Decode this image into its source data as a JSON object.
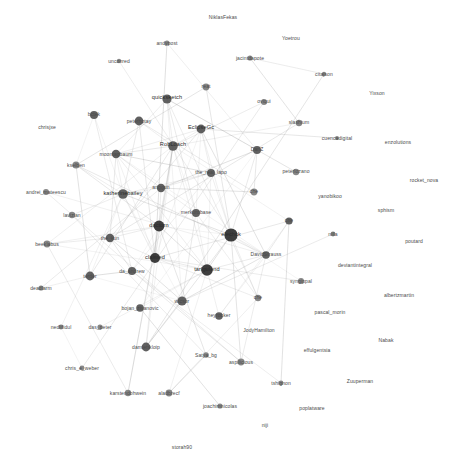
{
  "figure": {
    "type": "network-graph",
    "width": 457,
    "height": 461,
    "background": "#ffffff",
    "edge_color": "#9a9a9a",
    "node_fill_dark": "#2f2f2f",
    "node_fill_mid": "#545454",
    "node_fill_light": "#7d7d7d",
    "label_color": "#3a3a3a"
  },
  "chart_data": {
    "type": "scatter",
    "title": "",
    "xlabel": "",
    "ylabel": "",
    "layout": "force-directed",
    "grid": false,
    "legend": null,
    "node_count": 62,
    "nodes": [
      {
        "id": "NiklasFekas",
        "label": "NiklasFekas",
        "x": 223,
        "y": 17,
        "r": 0,
        "degree": 0,
        "lx": 223,
        "ly": 17,
        "cls": "sm"
      },
      {
        "id": "Yoetrou",
        "label": "Yoetrou",
        "x": 291,
        "y": 38,
        "r": 0,
        "degree": 0,
        "lx": 291,
        "ly": 38,
        "cls": "sm"
      },
      {
        "id": "Yixson",
        "label": "Yixson",
        "x": 377,
        "y": 93,
        "r": 0,
        "degree": 0,
        "lx": 377,
        "ly": 93,
        "cls": "sm"
      },
      {
        "id": "andypost",
        "label": "andypost",
        "x": 167,
        "y": 43,
        "r": 2.6,
        "degree": 9,
        "lx": 167,
        "ly": 43,
        "cls": "sm"
      },
      {
        "id": "unconred",
        "label": "unconred",
        "x": 119,
        "y": 61,
        "r": 2.2,
        "degree": 5,
        "lx": 119,
        "ly": 61,
        "cls": "sm"
      },
      {
        "id": "jacintdapote",
        "label": "jacintdapote",
        "x": 250,
        "y": 58,
        "r": 2.6,
        "degree": 8,
        "lx": 250,
        "ly": 58,
        "cls": "sm"
      },
      {
        "id": "citajson",
        "label": "citajson",
        "x": 324,
        "y": 74,
        "r": 2.2,
        "degree": 4,
        "lx": 324,
        "ly": 74,
        "cls": "sm"
      },
      {
        "id": "reat",
        "label": "reat",
        "x": 206,
        "y": 87,
        "r": 3.4,
        "degree": 14,
        "lx": 206,
        "ly": 86,
        "cls": "sm"
      },
      {
        "id": "quicksketch",
        "label": "quicksketch",
        "x": 167,
        "y": 99,
        "r": 4.6,
        "degree": 26,
        "lx": 167,
        "ly": 98,
        "cls": "lg"
      },
      {
        "id": "oviqui",
        "label": "oviqui",
        "x": 264,
        "y": 102,
        "r": 3.0,
        "degree": 10,
        "lx": 264,
        "ly": 101,
        "cls": "sm"
      },
      {
        "id": "chrisjxe",
        "label": "chrisjxe",
        "x": 47,
        "y": 127,
        "r": 0,
        "degree": 0,
        "lx": 47,
        "ly": 127,
        "cls": "sm"
      },
      {
        "id": "bctek",
        "label": "bctek",
        "x": 94,
        "y": 115,
        "r": 4.0,
        "degree": 19,
        "lx": 94,
        "ly": 114,
        "cls": "sm"
      },
      {
        "id": "peterhotay",
        "label": "peterhotay",
        "x": 139,
        "y": 121,
        "r": 4.4,
        "degree": 23,
        "lx": 139,
        "ly": 121,
        "cls": "sm"
      },
      {
        "id": "EclipseGc",
        "label": "EclipseGc",
        "x": 201,
        "y": 129,
        "r": 4.4,
        "degree": 24,
        "lx": 201,
        "ly": 128,
        "cls": "lg"
      },
      {
        "id": "slashium",
        "label": "slashium",
        "x": 299,
        "y": 123,
        "r": 3.2,
        "degree": 12,
        "lx": 299,
        "ly": 122,
        "cls": "sm"
      },
      {
        "id": "cuencadigital",
        "label": "cuencadigital",
        "x": 337,
        "y": 138,
        "r": 2.0,
        "degree": 3,
        "lx": 337,
        "ly": 138,
        "cls": "sm"
      },
      {
        "id": "enzolutions",
        "label": "enzolutions",
        "x": 398,
        "y": 142,
        "r": 0,
        "degree": 0,
        "lx": 398,
        "ly": 142,
        "cls": "sm"
      },
      {
        "id": "RobLoach",
        "label": "RobLoach",
        "x": 173,
        "y": 146,
        "r": 4.8,
        "degree": 28,
        "lx": 173,
        "ly": 145,
        "cls": "lg"
      },
      {
        "id": "moontagbaum",
        "label": "moontagbaum",
        "x": 116,
        "y": 154,
        "r": 4.2,
        "degree": 21,
        "lx": 116,
        "ly": 154,
        "cls": "sm"
      },
      {
        "id": "DanZ",
        "label": "DanZ",
        "x": 257,
        "y": 150,
        "r": 4.0,
        "degree": 18,
        "lx": 257,
        "ly": 149,
        "cls": "sm"
      },
      {
        "id": "kselben",
        "label": "kselben",
        "x": 76,
        "y": 165,
        "r": 3.6,
        "degree": 15,
        "lx": 76,
        "ly": 165,
        "cls": "sm"
      },
      {
        "id": "peterlozano",
        "label": "peterlozano",
        "x": 296,
        "y": 172,
        "r": 3.2,
        "degree": 11,
        "lx": 296,
        "ly": 171,
        "cls": "sm"
      },
      {
        "id": "the_real_lapo",
        "label": "the_real_lapo",
        "x": 211,
        "y": 173,
        "r": 4.0,
        "degree": 19,
        "lx": 211,
        "ly": 172,
        "cls": "sm"
      },
      {
        "id": "andrei_mateescu",
        "label": "andrei_mateescu",
        "x": 46,
        "y": 192,
        "r": 3.0,
        "degree": 9,
        "lx": 46,
        "ly": 192,
        "cls": "sm"
      },
      {
        "id": "katherinebailey",
        "label": "katherinebailey",
        "x": 123,
        "y": 194,
        "r": 4.8,
        "degree": 29,
        "lx": 123,
        "ly": 194,
        "cls": "lg"
      },
      {
        "id": "rocket_nova",
        "label": "rocket_nova",
        "x": 424,
        "y": 180,
        "r": 0,
        "degree": 0,
        "lx": 424,
        "ly": 180,
        "cls": "sm"
      },
      {
        "id": "anggun",
        "label": "anggun",
        "x": 161,
        "y": 188,
        "r": 4.2,
        "degree": 22,
        "lx": 161,
        "ly": 187,
        "cls": "sm"
      },
      {
        "id": "che1",
        "label": "che",
        "x": 254,
        "y": 192,
        "r": 3.4,
        "degree": 13,
        "lx": 254,
        "ly": 191,
        "cls": "sm"
      },
      {
        "id": "yanobikoo",
        "label": "yanobikoo",
        "x": 330,
        "y": 196,
        "r": 0,
        "degree": 0,
        "lx": 330,
        "ly": 196,
        "cls": "sm"
      },
      {
        "id": "lavizian",
        "label": "lavizian",
        "x": 72,
        "y": 215,
        "r": 3.2,
        "degree": 11,
        "lx": 72,
        "ly": 215,
        "cls": "sm"
      },
      {
        "id": "merkurobase",
        "label": "merkurobase",
        "x": 196,
        "y": 213,
        "r": 4.0,
        "degree": 20,
        "lx": 196,
        "ly": 212,
        "cls": "sm"
      },
      {
        "id": "sphism",
        "label": "sphism",
        "x": 386,
        "y": 210,
        "r": 0,
        "degree": 0,
        "lx": 386,
        "ly": 210,
        "cls": "sm"
      },
      {
        "id": "che2",
        "label": "che",
        "x": 289,
        "y": 221,
        "r": 3.6,
        "degree": 16,
        "lx": 289,
        "ly": 220,
        "cls": "sm"
      },
      {
        "id": "dactorn",
        "label": "dactorn",
        "x": 159,
        "y": 226,
        "r": 5.4,
        "degree": 34,
        "lx": 159,
        "ly": 226,
        "cls": "lg"
      },
      {
        "id": "elechck",
        "label": "elechck",
        "x": 231,
        "y": 235,
        "r": 6.6,
        "degree": 48,
        "lx": 231,
        "ly": 235,
        "cls": "lg"
      },
      {
        "id": "nilla",
        "label": "nilla",
        "x": 333,
        "y": 234,
        "r": 2.4,
        "degree": 6,
        "lx": 333,
        "ly": 234,
        "cls": "sm"
      },
      {
        "id": "poutard",
        "label": "poutard",
        "x": 414,
        "y": 241,
        "r": 0,
        "degree": 0,
        "lx": 414,
        "ly": 241,
        "cls": "sm"
      },
      {
        "id": "beeklabus",
        "label": "beeklabus",
        "x": 47,
        "y": 244,
        "r": 3.4,
        "degree": 13,
        "lx": 47,
        "ly": 244,
        "cls": "sm"
      },
      {
        "id": "the_kun",
        "label": "the_kun",
        "x": 110,
        "y": 238,
        "r": 4.2,
        "degree": 21,
        "lx": 110,
        "ly": 238,
        "cls": "sm"
      },
      {
        "id": "DavidStrauss",
        "label": "DavidStrauss",
        "x": 266,
        "y": 255,
        "r": 3.8,
        "degree": 17,
        "lx": 266,
        "ly": 254,
        "cls": "sm"
      },
      {
        "id": "deviantintegral",
        "label": "deviantintegral",
        "x": 355,
        "y": 265,
        "r": 0,
        "degree": 0,
        "lx": 355,
        "ly": 265,
        "cls": "sm"
      },
      {
        "id": "claimed",
        "label": "claimed",
        "x": 155,
        "y": 258,
        "r": 5.0,
        "degree": 31,
        "lx": 155,
        "ly": 258,
        "cls": "lg"
      },
      {
        "id": "tarlgulend",
        "label": "tarlgulend",
        "x": 207,
        "y": 270,
        "r": 5.8,
        "degree": 38,
        "lx": 207,
        "ly": 270,
        "cls": "lg"
      },
      {
        "id": "da_andrew",
        "label": "da_andrew",
        "x": 132,
        "y": 271,
        "r": 4.0,
        "degree": 19,
        "lx": 132,
        "ly": 271,
        "cls": "sm"
      },
      {
        "id": "syngippal",
        "label": "syngippal",
        "x": 301,
        "y": 281,
        "r": 3.0,
        "degree": 10,
        "lx": 301,
        "ly": 281,
        "cls": "sm"
      },
      {
        "id": "albertzmartin",
        "label": "albertzmartin",
        "x": 399,
        "y": 295,
        "r": 0,
        "degree": 0,
        "lx": 399,
        "ly": 295,
        "cls": "sm"
      },
      {
        "id": "deadlarm",
        "label": "deadlarm",
        "x": 41,
        "y": 288,
        "r": 2.6,
        "degree": 7,
        "lx": 41,
        "ly": 288,
        "cls": "sm"
      },
      {
        "id": "terder",
        "label": "terder",
        "x": 90,
        "y": 276,
        "r": 4.4,
        "degree": 24,
        "lx": 90,
        "ly": 276,
        "cls": "sm"
      },
      {
        "id": "bojan_zivanovic",
        "label": "bojan_zivanovic",
        "x": 140,
        "y": 308,
        "r": 3.8,
        "degree": 17,
        "lx": 140,
        "ly": 308,
        "cls": "sm"
      },
      {
        "id": "wicsor",
        "label": "wicsor",
        "x": 182,
        "y": 301,
        "r": 4.6,
        "degree": 26,
        "lx": 182,
        "ly": 301,
        "cls": "sm"
      },
      {
        "id": "heyrocker",
        "label": "heyrocker",
        "x": 219,
        "y": 316,
        "r": 3.8,
        "degree": 16,
        "lx": 219,
        "ly": 315,
        "cls": "sm"
      },
      {
        "id": "che3",
        "label": "che",
        "x": 258,
        "y": 298,
        "r": 3.2,
        "degree": 11,
        "lx": 258,
        "ly": 297,
        "cls": "sm"
      },
      {
        "id": "JodyHamilton",
        "label": "JodyHamilton",
        "x": 259,
        "y": 330,
        "r": 0,
        "degree": 0,
        "lx": 259,
        "ly": 330,
        "cls": "sm"
      },
      {
        "id": "pascal_morin",
        "label": "pascal_morin",
        "x": 330,
        "y": 312,
        "r": 0,
        "degree": 0,
        "lx": 330,
        "ly": 312,
        "cls": "sm"
      },
      {
        "id": "Nabak",
        "label": "Nabak",
        "x": 386,
        "y": 340,
        "r": 0,
        "degree": 0,
        "lx": 386,
        "ly": 340,
        "cls": "sm"
      },
      {
        "id": "nedlifidul",
        "label": "nedlifidul",
        "x": 61,
        "y": 327,
        "r": 2.4,
        "degree": 5,
        "lx": 61,
        "ly": 327,
        "cls": "sm"
      },
      {
        "id": "das_peter",
        "label": "das_peter",
        "x": 100,
        "y": 327,
        "r": 2.6,
        "degree": 7,
        "lx": 100,
        "ly": 327,
        "cls": "sm"
      },
      {
        "id": "effulgentsia",
        "label": "effulgentsia",
        "x": 317,
        "y": 350,
        "r": 0,
        "degree": 0,
        "lx": 317,
        "ly": 350,
        "cls": "sm"
      },
      {
        "id": "damienkloip",
        "label": "damienkloip",
        "x": 146,
        "y": 347,
        "r": 4.4,
        "degree": 23,
        "lx": 146,
        "ly": 347,
        "cls": "sm"
      },
      {
        "id": "Satya_bg",
        "label": "Satya_bg",
        "x": 206,
        "y": 355,
        "r": 2.8,
        "degree": 8,
        "lx": 206,
        "ly": 355,
        "cls": "sm"
      },
      {
        "id": "aspilicious",
        "label": "aspilicious",
        "x": 241,
        "y": 362,
        "r": 3.4,
        "degree": 13,
        "lx": 241,
        "ly": 362,
        "cls": "sm"
      },
      {
        "id": "chris_e_weber",
        "label": "chris_e_weber",
        "x": 82,
        "y": 368,
        "r": 2.4,
        "degree": 5,
        "lx": 82,
        "ly": 368,
        "cls": "sm"
      },
      {
        "id": "karstendohwein",
        "label": "karstendohwein",
        "x": 128,
        "y": 393,
        "r": 3.2,
        "degree": 11,
        "lx": 128,
        "ly": 393,
        "cls": "sm"
      },
      {
        "id": "aladbrecf",
        "label": "aladbrecf",
        "x": 169,
        "y": 393,
        "r": 3.4,
        "degree": 13,
        "lx": 169,
        "ly": 393,
        "cls": "sm"
      },
      {
        "id": "tshignon",
        "label": "tshignon",
        "x": 281,
        "y": 383,
        "r": 2.4,
        "degree": 6,
        "lx": 281,
        "ly": 383,
        "cls": "sm"
      },
      {
        "id": "Zuuperman",
        "label": "Zuuperman",
        "x": 360,
        "y": 381,
        "r": 0,
        "degree": 0,
        "lx": 360,
        "ly": 381,
        "cls": "sm"
      },
      {
        "id": "joachimnicolas",
        "label": "joachimnicolas",
        "x": 220,
        "y": 406,
        "r": 2.6,
        "degree": 7,
        "lx": 220,
        "ly": 406,
        "cls": "sm"
      },
      {
        "id": "poplatware",
        "label": "poplatware",
        "x": 312,
        "y": 408,
        "r": 0,
        "degree": 0,
        "lx": 312,
        "ly": 408,
        "cls": "sm"
      },
      {
        "id": "niji",
        "label": "niji",
        "x": 265,
        "y": 425,
        "r": 0,
        "degree": 0,
        "lx": 265,
        "ly": 425,
        "cls": "sm"
      },
      {
        "id": "storah90",
        "label": "storah90",
        "x": 182,
        "y": 447,
        "r": 0,
        "degree": 0,
        "lx": 182,
        "ly": 447,
        "cls": "sm"
      }
    ],
    "hub_ids": [
      "elechck",
      "tarlgulend",
      "dactorn",
      "claimed",
      "katherinebailey",
      "RobLoach",
      "quicksketch",
      "wicsor",
      "terder",
      "EclipseGc"
    ]
  }
}
